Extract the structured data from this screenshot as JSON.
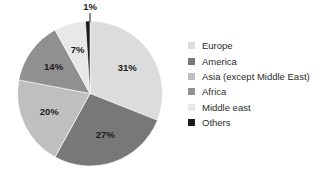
{
  "chart_data": {
    "type": "pie",
    "title": "",
    "categories": [
      "Europe",
      "America",
      "Asia (except Middle East)",
      "Africa",
      "Middle east",
      "Others"
    ],
    "values": [
      31,
      27,
      20,
      14,
      7,
      1
    ],
    "value_labels": [
      "31%",
      "27%",
      "20%",
      "14%",
      "7%",
      "1%"
    ],
    "unit": "%",
    "colors": [
      "#dcdcdc",
      "#787878",
      "#bfbfbf",
      "#909090",
      "#e8e8e8",
      "#1a1a1a"
    ],
    "start_angle_deg": 0,
    "direction": "clockwise",
    "legend_position": "right",
    "grid": false,
    "slices": [
      {
        "label": "Europe",
        "value": 31,
        "value_label": "31%",
        "color": "#dcdcdc",
        "label_placement": "inside"
      },
      {
        "label": "America",
        "value": 27,
        "value_label": "27%",
        "color": "#787878",
        "label_placement": "inside"
      },
      {
        "label": "Asia (except Middle East)",
        "value": 20,
        "value_label": "20%",
        "color": "#bfbfbf",
        "label_placement": "inside"
      },
      {
        "label": "Africa",
        "value": 14,
        "value_label": "14%",
        "color": "#909090",
        "label_placement": "inside"
      },
      {
        "label": "Middle east",
        "value": 7,
        "value_label": "7%",
        "color": "#e8e8e8",
        "label_placement": "inside"
      },
      {
        "label": "Others",
        "value": 1,
        "value_label": "1%",
        "color": "#1a1a1a",
        "label_placement": "callout-above"
      }
    ]
  },
  "legend": {
    "items": [
      {
        "label": "Europe",
        "color": "#dcdcdc"
      },
      {
        "label": "America",
        "color": "#787878"
      },
      {
        "label": "Asia (except Middle East)",
        "color": "#bfbfbf"
      },
      {
        "label": "Africa",
        "color": "#909090"
      },
      {
        "label": "Middle east",
        "color": "#e8e8e8"
      },
      {
        "label": "Others",
        "color": "#1a1a1a"
      }
    ]
  },
  "labels": {
    "europe_pct": "31%",
    "america_pct": "27%",
    "asia_pct": "20%",
    "africa_pct": "14%",
    "middle_east_pct": "7%",
    "others_pct": "1%"
  }
}
